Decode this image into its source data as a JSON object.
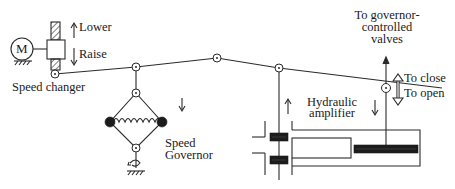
{
  "diagram": {
    "colors": {
      "line": "#2a2a2a",
      "fill_dark": "#1c1c1c",
      "background": "#ffffff"
    },
    "labels": {
      "motor": "M",
      "lower": "Lower",
      "raise": "Raise",
      "speed_changer": "Speed changer",
      "speed_governor_line1": "Speed",
      "speed_governor_line2": "Governor",
      "hydraulic_line1": "Hydraulic",
      "hydraulic_line2": "amplifier",
      "valves_line1": "To governor-",
      "valves_line2": "controlled",
      "valves_line3": "valves",
      "to_close": "To close",
      "to_open": "To open"
    },
    "arrows": {
      "lower": "↑",
      "raise": "↓",
      "governor_motion": "↓",
      "pilot_motion": "↑",
      "piston_motion": "↓",
      "close_open": "⇕"
    }
  }
}
